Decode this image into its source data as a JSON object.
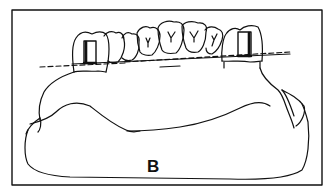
{
  "figure": {
    "panel_label": "B",
    "colors": {
      "line": "#111111",
      "background": "#ffffff"
    },
    "elements": [
      {
        "name": "frame-border"
      },
      {
        "name": "left-abutment-tooth"
      },
      {
        "name": "right-abutment-tooth"
      },
      {
        "name": "anterior-teeth"
      },
      {
        "name": "occlusal-plane-dashed-line"
      },
      {
        "name": "cast-base"
      }
    ]
  }
}
